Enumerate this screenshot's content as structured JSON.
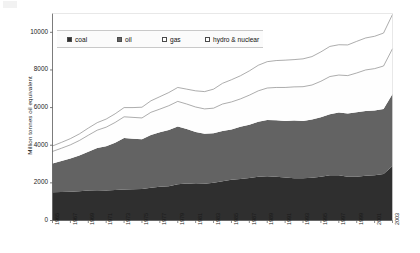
{
  "chart_data": {
    "type": "area",
    "stacked": true,
    "title": "",
    "subtitle": "",
    "xlabel": "",
    "ylabel": "Million tonnes oil equivalent",
    "ylim": [
      0,
      11000
    ],
    "yticks": [
      0,
      2000,
      4000,
      6000,
      8000,
      10000
    ],
    "ytick_labels": [
      "0",
      "2000",
      "4000",
      "6000",
      "8000",
      "10000"
    ],
    "grid": false,
    "legend_position": "top-left-inside",
    "x": [
      1965,
      1966,
      1967,
      1968,
      1969,
      1970,
      1971,
      1972,
      1973,
      1974,
      1975,
      1976,
      1977,
      1978,
      1979,
      1980,
      1981,
      1982,
      1983,
      1984,
      1985,
      1986,
      1987,
      1988,
      1989,
      1990,
      1991,
      1992,
      1993,
      1994,
      1995,
      1996,
      1997,
      1998,
      1999,
      2000,
      2001,
      2002,
      2003
    ],
    "xtick_labels": [
      "1965",
      "1967",
      "1969",
      "1971",
      "1973",
      "1975",
      "1977",
      "1979",
      "1981",
      "1983",
      "1985",
      "1987",
      "1989",
      "1991",
      "1993",
      "1995",
      "1997",
      "1999",
      "2001",
      "2003"
    ],
    "series": [
      {
        "name": "coal",
        "color": "#2f2f2f",
        "values": [
          1500,
          1520,
          1530,
          1560,
          1600,
          1610,
          1600,
          1620,
          1650,
          1660,
          1680,
          1740,
          1790,
          1820,
          1920,
          1960,
          1940,
          1950,
          2010,
          2080,
          2170,
          2200,
          2260,
          2320,
          2350,
          2320,
          2280,
          2250,
          2250,
          2270,
          2330,
          2400,
          2400,
          2330,
          2320,
          2380,
          2410,
          2470,
          2900
        ]
      },
      {
        "name": "oil",
        "color": "#636363",
        "values": [
          1530,
          1640,
          1760,
          1890,
          2050,
          2240,
          2340,
          2510,
          2730,
          2690,
          2640,
          2810,
          2900,
          2990,
          3070,
          2900,
          2760,
          2660,
          2620,
          2680,
          2670,
          2780,
          2830,
          2930,
          2990,
          3010,
          3010,
          3060,
          3040,
          3100,
          3160,
          3250,
          3340,
          3350,
          3430,
          3440,
          3440,
          3460,
          3820
        ]
      },
      {
        "name": "gas",
        "color": "#fefefe",
        "values": [
          640,
          680,
          730,
          800,
          880,
          950,
          1020,
          1080,
          1130,
          1130,
          1130,
          1200,
          1230,
          1290,
          1340,
          1330,
          1330,
          1320,
          1340,
          1430,
          1460,
          1480,
          1570,
          1640,
          1700,
          1740,
          1780,
          1790,
          1820,
          1830,
          1910,
          2000,
          1990,
          2020,
          2090,
          2180,
          2220,
          2280,
          2410
        ]
      },
      {
        "name": "hydro & nuclear",
        "color": "#ffffff",
        "values": [
          290,
          310,
          330,
          350,
          380,
          400,
          430,
          460,
          490,
          520,
          570,
          610,
          660,
          700,
          740,
          790,
          860,
          920,
          1010,
          1100,
          1180,
          1230,
          1290,
          1360,
          1400,
          1430,
          1450,
          1450,
          1480,
          1510,
          1560,
          1600,
          1610,
          1630,
          1680,
          1700,
          1720,
          1750,
          1820
        ]
      }
    ],
    "totals": [
      3960,
      4150,
      4350,
      4600,
      4910,
      5200,
      5390,
      5670,
      6000,
      6000,
      6020,
      6360,
      6580,
      6800,
      7070,
      6980,
      6890,
      6850,
      6980,
      7290,
      7480,
      7690,
      7950,
      8250,
      8440,
      8500,
      8520,
      8550,
      8590,
      8710,
      8960,
      9250,
      9340,
      9330,
      9520,
      9700,
      9790,
      9960,
      10950
    ]
  },
  "legend": {
    "items": [
      {
        "label": "coal",
        "swatch": "#2f2f2f"
      },
      {
        "label": "oil",
        "swatch": "#636363"
      },
      {
        "label": "gas",
        "swatch": "#ffffff"
      },
      {
        "label": "hydro & nuclear",
        "swatch": "#ffffff"
      }
    ]
  }
}
